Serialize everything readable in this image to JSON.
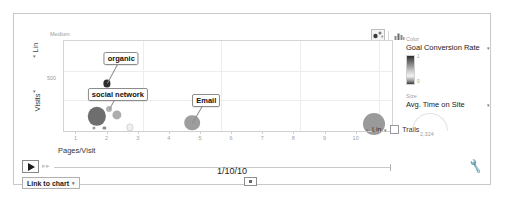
{
  "chart_data": {
    "type": "scatter",
    "title": "",
    "xlabel": "Pages/Visit",
    "ylabel": "Visits",
    "xlim": [
      0.6,
      11.2
    ],
    "ylim": [
      0,
      1200
    ],
    "x_scale": "Lin",
    "y_scale": "Lin",
    "grid": true,
    "x_ticks": [
      "1",
      "2",
      "3",
      "4",
      "5",
      "6",
      "7",
      "8",
      "9",
      "10"
    ],
    "y_ticks": [
      "500"
    ],
    "y_top_label": "Medium",
    "size_metric": "Avg. Time on Site",
    "size_max_value": "2,324",
    "color_metric": "Goal Conversion Rate",
    "color_max": "1",
    "color_min": "0",
    "points": [
      {
        "label": "organic",
        "x": 1.99,
        "y": 640,
        "r": 3.6,
        "color": "#2e2e2e",
        "labeled": true
      },
      {
        "label": "social network",
        "x": 2.04,
        "y": 300,
        "r": 3.0,
        "color": "#b4b4b4",
        "labeled": true
      },
      {
        "label": "Email",
        "x": 4.72,
        "y": 120,
        "r": 7.8,
        "color": "#9d9d9d",
        "labeled": true
      },
      {
        "label": "",
        "x": 1.66,
        "y": 205,
        "r": 9.2,
        "color": "#6e6e6e",
        "labeled": false
      },
      {
        "label": "",
        "x": 2.31,
        "y": 230,
        "r": 4.6,
        "color": "#adadad",
        "labeled": false
      },
      {
        "label": "",
        "x": 10.55,
        "y": 110,
        "r": 11.0,
        "color": "#9a9a9a",
        "labeled": false
      },
      {
        "label": "",
        "x": 1.55,
        "y": 55,
        "r": 1.6,
        "color": "#9a9a9a",
        "labeled": false
      },
      {
        "label": "",
        "x": 1.9,
        "y": 55,
        "r": 1.6,
        "color": "#8e8e8e",
        "labeled": false
      },
      {
        "label": "",
        "x": 2.72,
        "y": 60,
        "r": 2.6,
        "color": "#f0f0f0",
        "labeled": false
      }
    ]
  },
  "chart_toggles": {
    "bubble_label": "bubble-chart-toggle",
    "bar_label": "bar-chart-toggle",
    "selected": "bubble"
  },
  "axis_options": {
    "scale_label": "Lin",
    "trails_label": "Trails",
    "trails_checked": false
  },
  "panel": {
    "color_section_label": "Color",
    "color_metric": "Goal Conversion Rate",
    "gradient_max": "1",
    "gradient_min": "0",
    "size_section_label": "Size",
    "size_metric": "Avg. Time on Site",
    "size_value": "2,324"
  },
  "player": {
    "play_label": "▶",
    "date": "1/10/10",
    "link_to_chart_label": "Link to chart",
    "link_caret": "▾",
    "settings_icon": "wrench-icon"
  }
}
